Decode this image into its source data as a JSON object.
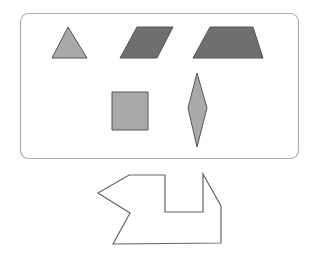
{
  "header": {
    "cutoff_text": ""
  },
  "panel": {
    "x": 20,
    "y": 13,
    "width": 278,
    "height": 145,
    "radius": 8,
    "stroke": "#b0b0b0"
  },
  "colors": {
    "light_fill": "#a9a9a9",
    "dark_fill": "#6f6f6f",
    "stroke": "#555555",
    "outline": "#666666"
  },
  "shapes": [
    {
      "name": "triangle",
      "fill": "light",
      "points": "68,27 87,58 52,58"
    },
    {
      "name": "parallelogram",
      "fill": "dark",
      "points": "137,27 173,27 157,58 120,58"
    },
    {
      "name": "trapezoid",
      "fill": "dark",
      "points": "210,27 253,27 263,58 193,58"
    },
    {
      "name": "square",
      "fill": "light",
      "points": "112,92 148,92 148,130 112,130"
    },
    {
      "name": "rhombus",
      "fill": "light",
      "points": "197,73 207,108 197,147 188,108"
    }
  ],
  "outline_figure": {
    "name": "composite-outline",
    "points": "129,175 165,175 165,212 203,212 203,174 221,206 221,243 113,244 130,213 98,193"
  }
}
